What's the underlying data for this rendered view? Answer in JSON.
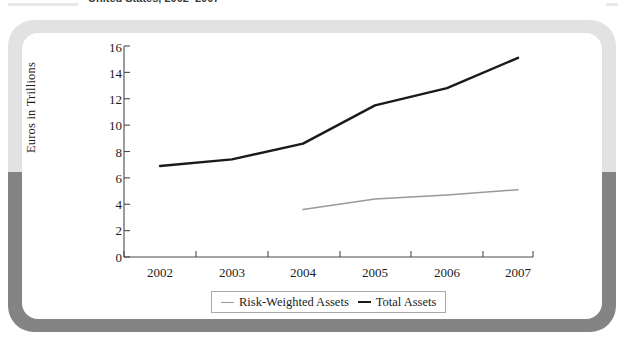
{
  "figure": {
    "caption": "United States, 2002–2007",
    "frame_top_color": "#e2e2e2",
    "frame_bottom_color": "#848484",
    "background_color": "#ffffff"
  },
  "chart_data": {
    "type": "line",
    "title": "United States, 2002–2007",
    "xlabel": "",
    "ylabel": "Euros in Trillions",
    "x": [
      2002,
      2003,
      2004,
      2005,
      2006,
      2007
    ],
    "xtick_labels": [
      "2002",
      "2003",
      "2004",
      "2005",
      "2006",
      "2007"
    ],
    "ytick_labels": [
      "0",
      "2",
      "4",
      "6",
      "8",
      "10",
      "12",
      "14",
      "16"
    ],
    "yticks": [
      0,
      2,
      4,
      6,
      8,
      10,
      12,
      14,
      16
    ],
    "ylim": [
      0,
      16
    ],
    "xlim": [
      2002,
      2007
    ],
    "grid": false,
    "legend_position": "bottom-center",
    "series": [
      {
        "name": "Risk-Weighted Assets",
        "color": "#9a9a9a",
        "x": [
          2004,
          2005,
          2006,
          2007
        ],
        "values": [
          3.6,
          4.4,
          4.7,
          5.1
        ]
      },
      {
        "name": "Total Assets",
        "color": "#1a1a1a",
        "x": [
          2002,
          2003,
          2004,
          2005,
          2006,
          2007
        ],
        "values": [
          6.9,
          7.4,
          8.6,
          11.5,
          12.8,
          15.1
        ]
      }
    ]
  },
  "legend": {
    "items": [
      {
        "label": "Risk-Weighted Assets",
        "swatch": "rwa"
      },
      {
        "label": "Total Assets",
        "swatch": "total"
      }
    ]
  }
}
